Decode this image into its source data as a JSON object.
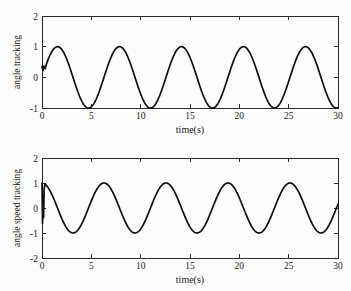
{
  "figure": {
    "background": "#fdfdfd",
    "line_color": "#0d0d0d",
    "axis_color": "#2b2b2b",
    "width": 351,
    "height": 291
  },
  "chart_data": [
    {
      "type": "line",
      "id": "angle-tracking",
      "title": "",
      "xlabel": "time(s)",
      "ylabel": "angle tracking",
      "xlim": [
        0,
        30
      ],
      "ylim": [
        -1,
        2
      ],
      "xticks": [
        0,
        5,
        10,
        15,
        20,
        25,
        30
      ],
      "yticks": [
        -1,
        0,
        1,
        2
      ],
      "xticklabels": [
        "0",
        "5",
        "10",
        "15",
        "20",
        "25",
        "30"
      ],
      "yticklabels": [
        "-1",
        "0",
        "1",
        "2"
      ],
      "grid": false,
      "legend": "none",
      "series": [
        {
          "name": "angle tracking",
          "formula": "sin(t)",
          "amplitude": 1.0,
          "omega": 1.0,
          "phase": 0.0,
          "initial_value": 0.35,
          "transient_span": 0.45,
          "peaks_t": [
            1.57,
            7.85,
            14.14,
            20.42,
            26.7
          ],
          "peaks_y": [
            1.0,
            1.0,
            1.0,
            1.0,
            1.0
          ],
          "troughs_t": [
            4.71,
            11.0,
            17.28,
            23.56,
            29.85
          ],
          "troughs_y": [
            -1.0,
            -1.0,
            -1.0,
            -1.0,
            -1.0
          ]
        }
      ]
    },
    {
      "type": "line",
      "id": "angle-speed-tracking",
      "title": "",
      "xlabel": "time(s)",
      "ylabel": "angle speed tracking",
      "xlim": [
        0,
        30
      ],
      "ylim": [
        -2,
        2
      ],
      "xticks": [
        0,
        5,
        10,
        15,
        20,
        25,
        30
      ],
      "yticks": [
        -2,
        -1,
        0,
        1,
        2
      ],
      "xticklabels": [
        "0",
        "5",
        "10",
        "15",
        "20",
        "25",
        "30"
      ],
      "yticklabels": [
        "-2",
        "-1",
        "0",
        "1",
        "2"
      ],
      "grid": false,
      "legend": "none",
      "series": [
        {
          "name": "angle speed tracking",
          "formula": "cos(t)",
          "amplitude": 1.0,
          "omega": 1.0,
          "phase": 1.5708,
          "initial_value": 1.0,
          "transient_span": 0.3,
          "transient_min": -0.62,
          "peaks_t": [
            0.0,
            6.28,
            12.57,
            18.85,
            25.13
          ],
          "peaks_y": [
            1.0,
            1.0,
            1.0,
            1.0,
            1.0
          ],
          "troughs_t": [
            3.14,
            9.42,
            15.71,
            21.99,
            28.27
          ],
          "troughs_y": [
            -1.0,
            -1.0,
            -1.0,
            -1.0,
            -1.0
          ]
        }
      ]
    }
  ]
}
